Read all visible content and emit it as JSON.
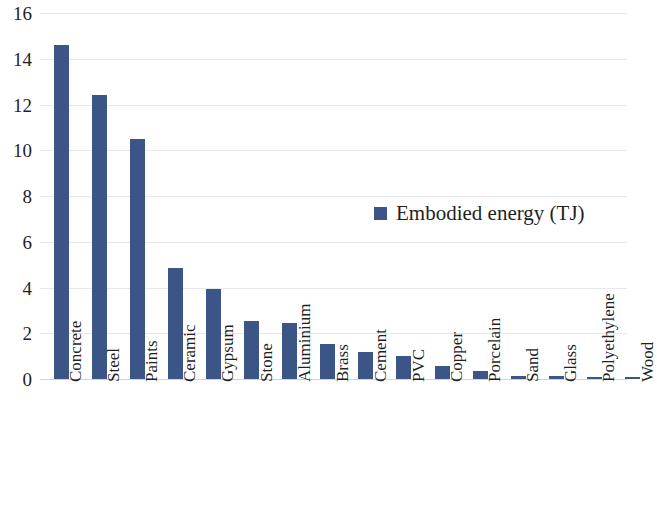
{
  "chart_data": {
    "type": "bar",
    "title": "",
    "xlabel": "",
    "ylabel": "",
    "ylim": [
      0,
      16
    ],
    "yticks": [
      0,
      2,
      4,
      6,
      8,
      10,
      12,
      14,
      16
    ],
    "grid": true,
    "legend_position": "inside-right",
    "series": [
      {
        "name": "Embodied energy (TJ)",
        "color": "#3c5587",
        "values": [
          14.6,
          12.4,
          10.5,
          4.85,
          3.95,
          2.55,
          2.45,
          1.55,
          1.2,
          1.0,
          0.55,
          0.35,
          0.15,
          0.13,
          0.1,
          0.07
        ]
      }
    ],
    "categories": [
      "Concrete",
      "Steel",
      "Paints",
      "Ceramic",
      "Gypsum",
      "Stone",
      "Aluminium",
      "Brass",
      "Cement",
      "PVC",
      "Copper",
      "Porcelain",
      "Sand",
      "Glass",
      "Polyethylene",
      "Wood"
    ]
  },
  "legend": {
    "items": [
      {
        "label": "Embodied energy (TJ)",
        "color": "#3c5587",
        "marker": "square-marker"
      }
    ]
  },
  "axes": {
    "y": {
      "tick_labels": [
        "16",
        "14",
        "12",
        "10",
        "8",
        "6",
        "4",
        "2",
        "0"
      ]
    }
  },
  "colors": {
    "bar": "#3c5587",
    "gridline": "#e8e8ec",
    "baseline": "#d2d2d8",
    "text": "#1f1f1f",
    "background": "#ffffff"
  }
}
